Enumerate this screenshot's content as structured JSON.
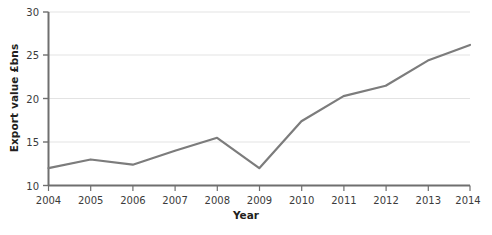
{
  "chart_data": {
    "type": "line",
    "title": "",
    "xlabel": "Year",
    "ylabel": "Export value £bns",
    "categories": [
      "2004",
      "2005",
      "2006",
      "2007",
      "2008",
      "2009",
      "2010",
      "2011",
      "2012",
      "2013",
      "2014"
    ],
    "x": [
      2004,
      2005,
      2006,
      2007,
      2008,
      2009,
      2010,
      2011,
      2012,
      2013,
      2014
    ],
    "values": [
      12.0,
      13.0,
      12.4,
      14.0,
      15.5,
      12.0,
      17.4,
      20.3,
      21.5,
      24.4,
      26.2
    ],
    "series": [
      {
        "name": "Export value",
        "values": [
          12.0,
          13.0,
          12.4,
          14.0,
          15.5,
          12.0,
          17.4,
          20.3,
          21.5,
          24.4,
          26.2
        ]
      }
    ],
    "ylim": [
      10,
      30
    ],
    "xlim": [
      2004,
      2014
    ],
    "yticks": [
      10,
      15,
      20,
      25,
      30
    ],
    "ytick_labels": [
      "10",
      "15",
      "20",
      "25",
      "30"
    ],
    "xticks": [
      2004,
      2005,
      2006,
      2007,
      2008,
      2009,
      2010,
      2011,
      2012,
      2013,
      2014
    ],
    "xtick_labels": [
      "2004",
      "2005",
      "2006",
      "2007",
      "2008",
      "2009",
      "2010",
      "2011",
      "2012",
      "2013",
      "2014"
    ],
    "grid": true,
    "grid_axis": "y",
    "legend": false,
    "legend_position": "none",
    "colors": {
      "line": "#7c7c7c",
      "grid": "#e3e3e3",
      "axis": "#6f6f6f",
      "tick_label": "#3b3b3b",
      "axis_label": "#231f20",
      "background": "#ffffff"
    },
    "line_width": 2.2
  }
}
